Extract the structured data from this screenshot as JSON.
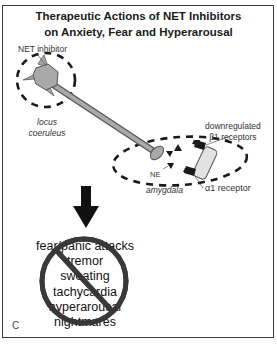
{
  "title": {
    "line1": "Therapeutic Actions of NET Inhibitors",
    "line2": "on Anxiety, Fear and Hyperarousal"
  },
  "labels": {
    "net_inhibitor": "NET inhibitor",
    "locus_coeruleus_1": "locus",
    "locus_coeruleus_2": "coeruleus",
    "downregulated_1": "downregulated",
    "downregulated_2": "β1 receptors",
    "ne": "NE",
    "amygdala": "amygdala",
    "alpha1_receptor": "α1 receptor"
  },
  "symptoms": [
    "fear/panic attacks",
    "tremor",
    "sweating",
    "tachycardia",
    "hyperarousal",
    "nightmares"
  ],
  "panel_letter": "C",
  "colors": {
    "neuron_fill": "#a9a9a9",
    "neuron_stroke": "#555555",
    "receptor_fill": "#e2e2e2",
    "dark": "#1a1a1a",
    "no_sign": "#3a3a3a"
  }
}
